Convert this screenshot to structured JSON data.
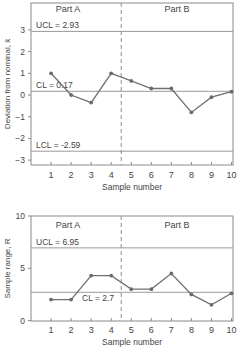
{
  "chart_data": [
    {
      "type": "line",
      "title": "",
      "xlabel": "Sample number",
      "ylabel": "Deviation from nominal, x̄",
      "x": [
        1,
        2,
        3,
        4,
        5,
        6,
        7,
        8,
        9,
        10
      ],
      "values": [
        1.0,
        0.0,
        -0.35,
        1.0,
        0.65,
        0.3,
        0.3,
        -0.8,
        -0.1,
        0.15
      ],
      "ylim": [
        -3.3,
        4.1
      ],
      "xlim": [
        0,
        10
      ],
      "yticks": [
        -3,
        -2,
        -1,
        0,
        1,
        2,
        3
      ],
      "xticks": [
        1,
        2,
        3,
        4,
        5,
        6,
        7,
        8,
        9,
        10
      ],
      "grid": false,
      "reference_lines": [
        {
          "name": "UCL",
          "value": 2.93,
          "label": "UCL = 2.93"
        },
        {
          "name": "CL",
          "value": 0.17,
          "label": "CL = 0.17"
        },
        {
          "name": "LCL",
          "value": -2.59,
          "label": "LCL = -2.59"
        }
      ],
      "divider": {
        "x": 4.5,
        "style": "dashed"
      },
      "regions": [
        {
          "label": "Part A"
        },
        {
          "label": "Part B"
        }
      ]
    },
    {
      "type": "line",
      "title": "",
      "xlabel": "Sample number",
      "ylabel": "Sample range, R",
      "x": [
        1,
        2,
        3,
        4,
        5,
        6,
        7,
        8,
        9,
        10
      ],
      "values": [
        2.0,
        2.0,
        4.3,
        4.3,
        3.0,
        3.0,
        4.5,
        2.5,
        1.5,
        2.6
      ],
      "ylim": [
        0,
        10
      ],
      "xlim": [
        0,
        10
      ],
      "yticks": [
        0,
        5,
        10
      ],
      "xticks": [
        1,
        2,
        3,
        4,
        5,
        6,
        7,
        8,
        9,
        10
      ],
      "grid": false,
      "reference_lines": [
        {
          "name": "UCL",
          "value": 6.95,
          "label": "UCL = 6.95"
        },
        {
          "name": "CL",
          "value": 2.7,
          "label": "CL = 2.7"
        }
      ],
      "divider": {
        "x": 4.5,
        "style": "dashed"
      },
      "regions": [
        {
          "label": "Part A"
        },
        {
          "label": "Part B"
        }
      ]
    }
  ],
  "colors": {
    "series": "#707070",
    "marker": "#6a6a6a",
    "ref_line": "#9a9a9a",
    "axis": "#8a8a8a",
    "text": "#444444"
  }
}
